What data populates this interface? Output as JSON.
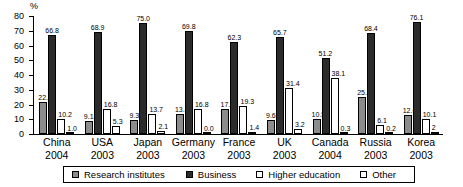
{
  "chart_data": {
    "type": "bar",
    "title": "",
    "xlabel": "",
    "ylabel": "%",
    "ylim": [
      0,
      80
    ],
    "yticks": [
      0,
      10,
      20,
      30,
      40,
      50,
      60,
      70,
      80
    ],
    "grid": false,
    "legend_position": "bottom",
    "categories": [
      "China",
      "USA",
      "Japan",
      "Germany",
      "France",
      "UK",
      "Canada",
      "Russia",
      "Korea"
    ],
    "years": [
      "2004",
      "2003",
      "2003",
      "2003",
      "2003",
      "2003",
      "2004",
      "2003",
      "2003"
    ],
    "series": [
      {
        "name": "Research institutes",
        "color": "#8c8c8c",
        "values": [
          22.0,
          9.1,
          9.3,
          13.4,
          17.1,
          9.65,
          10.5,
          25.3,
          12.6
        ],
        "labels": [
          "22.0",
          "9.1",
          "9.3",
          "13.4",
          "17.1",
          "9.65",
          "10.5",
          "25.3",
          "12.6"
        ]
      },
      {
        "name": "Business",
        "color": "#2b2b2b",
        "values": [
          66.8,
          68.9,
          75.0,
          69.8,
          62.3,
          65.7,
          51.2,
          68.4,
          76.1
        ],
        "labels": [
          "66.8",
          "68.9",
          "75.0",
          "69.8",
          "62.3",
          "65.7",
          "51.2",
          "68.4",
          "76.1"
        ]
      },
      {
        "name": "Higher education",
        "color": "#ffffff",
        "values": [
          10.2,
          16.8,
          13.7,
          16.8,
          19.3,
          31.4,
          38.1,
          6.1,
          10.1
        ],
        "labels": [
          "10.2",
          "16.8",
          "13.7",
          "16.8",
          "19.3",
          "31.4",
          "38.1",
          "6.1",
          "10.1"
        ]
      },
      {
        "name": "Other",
        "color": "#ffffff",
        "values": [
          1.0,
          5.3,
          2.1,
          0.0,
          1.4,
          3.2,
          0.3,
          0.2,
          1.2
        ],
        "labels": [
          "1.0",
          "5.3",
          "2.1",
          "0.0",
          "1.4",
          "3.2",
          "0.3",
          "0.2",
          "2"
        ]
      }
    ]
  },
  "axis": {
    "unit_label": "%"
  },
  "legend": {
    "items": [
      {
        "label": "Research institutes"
      },
      {
        "label": "Business"
      },
      {
        "label": "Higher education"
      },
      {
        "label": "Other"
      }
    ]
  }
}
